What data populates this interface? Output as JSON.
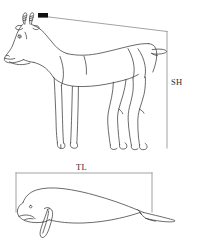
{
  "figure": {
    "background_color": "#ffffff",
    "line_color": "#3a3a3a",
    "accent_color": "#111111",
    "bracket_color": "#8c8c8c",
    "panels": [
      {
        "id": "saiga-panel",
        "subject": "saiga-antelope-line-drawing",
        "measurement": {
          "code": "SH",
          "label": "SH",
          "orientation": "vertical",
          "bracket": {
            "top_y": 31,
            "bottom_y": 148,
            "vertical_x": 167,
            "top_start_x": 45,
            "top_end_x": 167
          },
          "label_position": {
            "x": 171,
            "y": 78
          }
        },
        "marker": {
          "name": "withers-tick-marker",
          "x": 38,
          "y": 13,
          "width": 10,
          "height": 5,
          "color": "#111111"
        }
      },
      {
        "id": "dugong-panel",
        "subject": "dugong-line-drawing",
        "measurement": {
          "code": "TL",
          "label": "TL",
          "orientation": "horizontal",
          "bracket": {
            "left_x": 16,
            "right_x": 152,
            "top_y": 173,
            "bottom_y": 212
          },
          "label_position": {
            "x": 76,
            "y": 163
          }
        }
      }
    ]
  }
}
